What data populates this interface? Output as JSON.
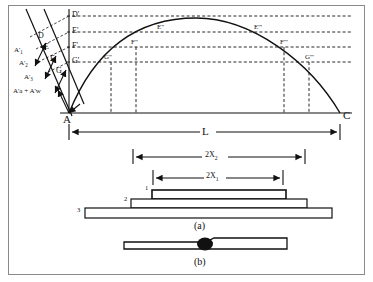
{
  "figure": {
    "frame_color": "#8a8a8a",
    "line_color": "#111111",
    "background": "#ffffff"
  },
  "curve_labels": {
    "origin": "A",
    "end": "C",
    "slant_line_points": [
      "D",
      "E",
      "F",
      "G"
    ],
    "axis_points": [
      "D'",
      "E'",
      "F'",
      "G'"
    ],
    "left_branch_points": [
      "E\"",
      "F\"",
      "G\""
    ],
    "right_branch_points": [
      "E'''",
      "F'''",
      "G'''"
    ]
  },
  "force_labels": [
    "A'",
    "A'",
    "A'",
    "A'a + A'w"
  ],
  "force_subscripts": [
    "1",
    "2",
    "3",
    ""
  ],
  "dimensions": [
    {
      "label": "L",
      "name": "total-length"
    },
    {
      "label": "2X",
      "sub": "2",
      "name": "span-2x2"
    },
    {
      "label": "2X",
      "sub": "1",
      "name": "span-2x1"
    }
  ],
  "layers": {
    "numbers": [
      "1",
      "2",
      "3"
    ],
    "caption": "(a)"
  },
  "panel_b": {
    "caption": "(b)"
  }
}
